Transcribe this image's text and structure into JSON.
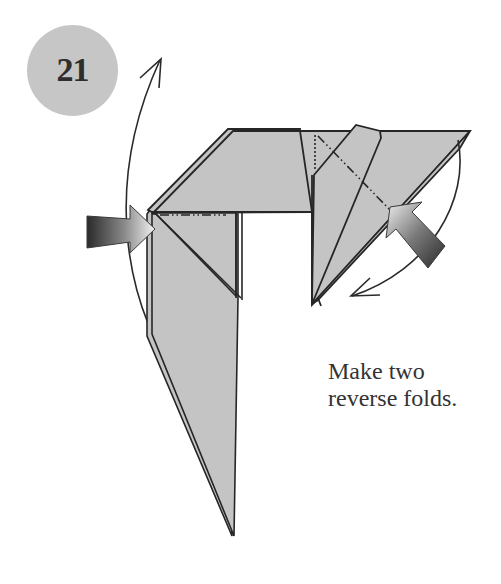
{
  "step": {
    "number": "21",
    "badge_color": "#c6c6c6"
  },
  "caption": {
    "line1": "Make two",
    "line2": "reverse folds."
  },
  "diagram": {
    "paper_color": "#c4c4c4",
    "outline_color": "#262626",
    "elements": [
      {
        "name": "left-push-arrow",
        "type": "gradient-push-arrow",
        "direction": "right"
      },
      {
        "name": "right-push-arrow",
        "type": "gradient-push-arrow",
        "direction": "up-left"
      },
      {
        "name": "left-curved-arrow",
        "type": "curved-motion-arrow",
        "direction": "up"
      },
      {
        "name": "right-curved-arrow",
        "type": "curved-motion-arrow",
        "direction": "down-left"
      },
      {
        "name": "left-fold-line",
        "type": "mountain-fold-line"
      },
      {
        "name": "right-fold-line",
        "type": "mountain-fold-line"
      },
      {
        "name": "right-hidden-line",
        "type": "dotted-line"
      }
    ]
  }
}
